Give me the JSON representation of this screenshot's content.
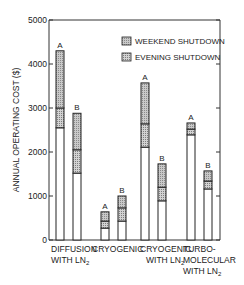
{
  "chart_data": {
    "type": "bar",
    "subtype": "stacked",
    "title": "",
    "xlabel": "",
    "ylabel": "ANNUAL OPERATING COST ($)",
    "ylim": [
      0,
      5000
    ],
    "yticks": [
      0,
      1000,
      2000,
      3000,
      4000,
      5000
    ],
    "grid": false,
    "legend_position": "upper right",
    "legend": [
      {
        "name": "WEEKEND SHUTDOWN",
        "pattern": "dense-hatch"
      },
      {
        "name": "EVENING SHUTDOWN",
        "pattern": "light-hatch"
      }
    ],
    "groups": [
      {
        "label_line1": "DIFFUSION",
        "label_line2": "WITH LN",
        "label_sub": "2",
        "label_line3": "",
        "bars": [
          {
            "label": "A",
            "full": 4300,
            "evening": 3000,
            "weekend": 2550
          },
          {
            "label": "B",
            "full": 2880,
            "evening": 2050,
            "weekend": 1520
          }
        ]
      },
      {
        "label_line1": "CRYOGENIC",
        "label_line2": "",
        "label_sub": "",
        "label_line3": "",
        "bars": [
          {
            "label": "A",
            "full": 640,
            "evening": 430,
            "weekend": 270
          },
          {
            "label": "B",
            "full": 1000,
            "evening": 730,
            "weekend": 430
          }
        ]
      },
      {
        "label_line1": "CRYOGENIC",
        "label_line2": "WITH LN",
        "label_sub": "2",
        "label_line3": "",
        "bars": [
          {
            "label": "A",
            "full": 3570,
            "evening": 2640,
            "weekend": 2110
          },
          {
            "label": "B",
            "full": 1730,
            "evening": 1200,
            "weekend": 890
          }
        ]
      },
      {
        "label_line1": "TURBO-",
        "label_line2": "MOLECULAR",
        "label_sub": "",
        "label_line3": "WITH LN",
        "label_line3_sub": "2",
        "bars": [
          {
            "label": "A",
            "full": 2660,
            "evening": 2520,
            "weekend": 2390
          },
          {
            "label": "B",
            "full": 1570,
            "evening": 1340,
            "weekend": 1160
          }
        ]
      }
    ]
  }
}
